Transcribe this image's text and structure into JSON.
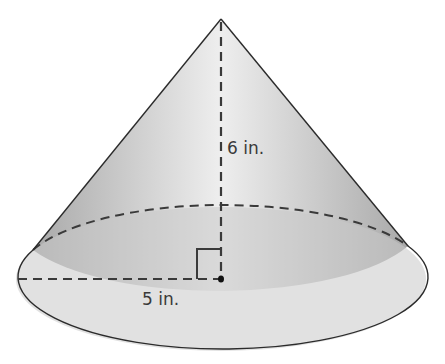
{
  "figure": {
    "shape": "right circular cone",
    "height_label": "6 in.",
    "radius_label": "5 in.",
    "colors": {
      "outline": "#2b2b2b",
      "dashed": "#3a3a3a",
      "fill_light": "#e6e6e6",
      "fill_dark": "#b5b5b5",
      "base_fill": "#c9c9c9",
      "background": "#ffffff"
    }
  }
}
